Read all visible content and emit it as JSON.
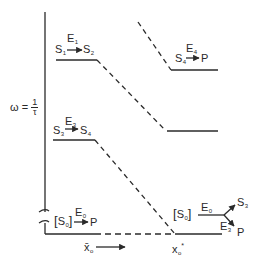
{
  "diagram": {
    "type": "enzyme reaction scheme frequency diagram",
    "y_axis_label": {
      "lhs": "ω",
      "eq": "=",
      "num": "1",
      "den": "τ"
    },
    "x_axis": {
      "mean_label": "x̄",
      "mean_sub": "o",
      "critical_label": "x",
      "critical_sub": "o",
      "critical_sup": "*"
    },
    "levels": [
      {
        "name": "level-1",
        "enzyme": "E",
        "enzyme_sub": "1",
        "reactant": "S",
        "reactant_sub": "1",
        "product": "S",
        "product_sub": "2"
      },
      {
        "name": "level-3",
        "enzyme": "E",
        "enzyme_sub": "3",
        "reactant": "S",
        "reactant_sub": "3",
        "product": "S",
        "product_sub": "4"
      },
      {
        "name": "level-4",
        "enzyme": "E",
        "enzyme_sub": "4",
        "reactant": "S",
        "reactant_sub": "4",
        "product": "P"
      }
    ],
    "bottom_left": {
      "open": "[",
      "species": "S",
      "species_sub": "0",
      "close": "]",
      "enzyme": "E",
      "enzyme_sub": "0",
      "product": "P"
    },
    "bottom_right": {
      "open": "[",
      "species": "S",
      "species_sub": "0",
      "close": "]",
      "enzyme": "E",
      "enzyme_sub": "0",
      "branch_upper": "S",
      "branch_upper_sub": "3",
      "branch_lower_enzyme": "E",
      "branch_lower_enzyme_sub": "3",
      "branch_lower_product": "P"
    },
    "colors": {
      "ink": "#2a2a2a",
      "background": "#ffffff"
    }
  }
}
